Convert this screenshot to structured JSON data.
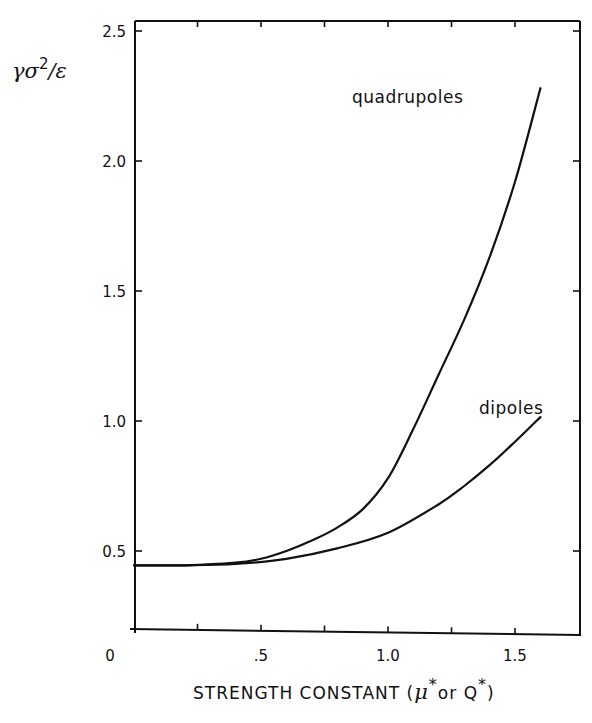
{
  "chart_data": {
    "type": "line",
    "title": "",
    "xlabel": "STRENGTH CONSTANT (μ* or Q*)",
    "xlabel_parts": {
      "prefix": "STRENGTH  CONSTANT (",
      "mu": "μ",
      "star": "*",
      "middle": "or Q",
      "suffix": ")"
    },
    "ylabel": "γσ²/ε",
    "ylabel_parts": {
      "base": "γσ",
      "sup": "2",
      "rest": "/ε"
    },
    "xlim": [
      0,
      1.75
    ],
    "ylim": [
      0.2,
      2.55
    ],
    "x_ticks": [
      0,
      0.25,
      0.5,
      0.75,
      1.0,
      1.25,
      1.5
    ],
    "x_tick_labels": [
      {
        "value": 0,
        "label": "0"
      },
      {
        "value": 0.5,
        "label": ".5"
      },
      {
        "value": 1.0,
        "label": "1.0"
      },
      {
        "value": 1.5,
        "label": "1.5"
      }
    ],
    "y_ticks": [
      0.5,
      1.0,
      1.5,
      2.0,
      2.5
    ],
    "y_tick_labels": [
      {
        "value": 0.5,
        "label": "0.5"
      },
      {
        "value": 1.0,
        "label": "1.0"
      },
      {
        "value": 1.5,
        "label": "1.5"
      },
      {
        "value": 2.0,
        "label": "2.0"
      },
      {
        "value": 2.5,
        "label": "2.5"
      }
    ],
    "grid": false,
    "legend": "inline labels",
    "series": [
      {
        "name": "quadrupoles",
        "x": [
          0,
          0.2,
          0.4,
          0.5,
          0.6,
          0.7,
          0.8,
          0.9,
          1.0,
          1.1,
          1.2,
          1.3,
          1.4,
          1.5,
          1.6
        ],
        "values": [
          0.445,
          0.445,
          0.455,
          0.47,
          0.5,
          0.54,
          0.59,
          0.66,
          0.78,
          0.97,
          1.18,
          1.39,
          1.63,
          1.92,
          2.28
        ],
        "label_pos": {
          "x": 352,
          "y": 103
        }
      },
      {
        "name": "dipoles",
        "x": [
          0,
          0.2,
          0.4,
          0.6,
          0.8,
          1.0,
          1.2,
          1.3,
          1.4,
          1.5,
          1.6
        ],
        "values": [
          0.445,
          0.445,
          0.45,
          0.47,
          0.51,
          0.57,
          0.68,
          0.75,
          0.83,
          0.92,
          1.015
        ],
        "label_pos": {
          "x": 479,
          "y": 414
        }
      }
    ]
  },
  "colors": {
    "ink": "#111111",
    "background": "#ffffff"
  }
}
